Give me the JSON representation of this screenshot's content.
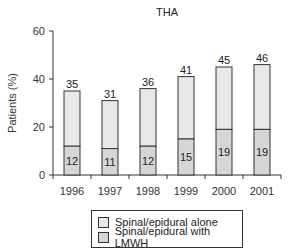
{
  "chart_data": {
    "type": "bar",
    "stacked": true,
    "title": "THA",
    "xlabel": "",
    "ylabel": "Patients (%)",
    "ylim": [
      0,
      60
    ],
    "yticks": [
      0,
      20,
      40,
      60
    ],
    "categories": [
      "1996",
      "1997",
      "1998",
      "1999",
      "2000",
      "2001"
    ],
    "series": [
      {
        "name": "Spinal/epidural with LMWH",
        "values": [
          12,
          11,
          12,
          15,
          19,
          19
        ],
        "color": "#d6d6d6"
      },
      {
        "name": "Spinal/epidural alone",
        "values": [
          23,
          20,
          24,
          26,
          26,
          27
        ],
        "color": "#e8e8e8"
      }
    ],
    "totals": [
      35,
      31,
      36,
      41,
      45,
      46
    ],
    "legend": [
      "Spinal/epidural alone",
      "Spinal/epidural with LMWH"
    ],
    "legend_position": "bottom",
    "grid": false
  }
}
